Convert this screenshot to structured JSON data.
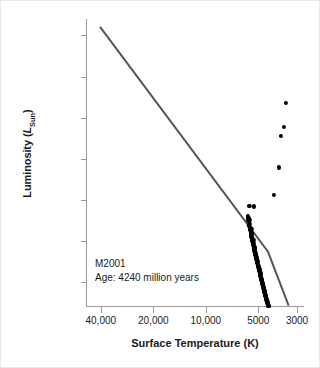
{
  "chart_data": {
    "type": "scatter",
    "title": "",
    "xlabel": "Surface Temperature (K)",
    "ylabel": "Luminosity (L_Sun)",
    "ylabel_parts": {
      "prefix": "Luminosity (",
      "italic": "L",
      "sub": "Sun",
      "suffix": ")"
    },
    "xscale": "log-reversed",
    "yscale": "log",
    "xlim": [
      48000,
      2700
    ],
    "ylim": [
      0.025,
      250000
    ],
    "xticks": [
      40000,
      20000,
      10000,
      5000,
      3000
    ],
    "xticklabels": [
      "40,000",
      "20,000",
      "10,000",
      "5000",
      "3000"
    ],
    "yticks": [
      100000,
      10000,
      1000,
      100,
      10,
      1,
      0.1
    ],
    "yticklabels": [
      "100,000",
      "10,000",
      "1000",
      "100",
      "10",
      "1",
      "0.1"
    ],
    "grid": false,
    "legend": null,
    "annotations": [
      {
        "name": "cluster-name",
        "text": "M2001"
      },
      {
        "name": "cluster-age",
        "text": "Age: 4240 million years"
      }
    ],
    "series": [
      {
        "name": "zero-age-main-sequence-line",
        "type": "line",
        "color": "#555555",
        "width": 2.0,
        "points": [
          [
            40400,
            160000
          ],
          [
            4400,
            0.55
          ],
          [
            3350,
            0.027
          ]
        ]
      },
      {
        "name": "main-sequence-stars",
        "type": "scatter",
        "color": "#000000",
        "marker": "circle",
        "size": 4.2,
        "points": [
          [
            5620,
            7.2
          ],
          [
            5280,
            7.0
          ],
          [
            5760,
            4.1
          ],
          [
            5700,
            3.7
          ],
          [
            5660,
            3.5
          ],
          [
            5710,
            3.2
          ],
          [
            5650,
            2.9
          ],
          [
            5600,
            3.3
          ],
          [
            5580,
            2.6
          ],
          [
            5640,
            2.4
          ],
          [
            5560,
            2.2
          ],
          [
            5600,
            2.0
          ],
          [
            5520,
            2.1
          ],
          [
            5560,
            1.85
          ],
          [
            5500,
            1.7
          ],
          [
            5540,
            1.6
          ],
          [
            5470,
            1.55
          ],
          [
            5510,
            1.45
          ],
          [
            5450,
            1.35
          ],
          [
            5480,
            1.28
          ],
          [
            5420,
            1.22
          ],
          [
            5440,
            1.15
          ],
          [
            5390,
            1.1
          ],
          [
            5410,
            1.02
          ],
          [
            5360,
            0.97
          ],
          [
            5380,
            0.92
          ],
          [
            5330,
            0.88
          ],
          [
            5350,
            0.82
          ],
          [
            5300,
            0.78
          ],
          [
            5320,
            0.74
          ],
          [
            5270,
            0.7
          ],
          [
            5290,
            0.66
          ],
          [
            5240,
            0.62
          ],
          [
            5260,
            0.59
          ],
          [
            5210,
            0.56
          ],
          [
            5230,
            0.53
          ],
          [
            5180,
            0.5
          ],
          [
            5200,
            0.47
          ],
          [
            5150,
            0.45
          ],
          [
            5170,
            0.42
          ],
          [
            5120,
            0.4
          ],
          [
            5140,
            0.38
          ],
          [
            5090,
            0.36
          ],
          [
            5110,
            0.34
          ],
          [
            5060,
            0.32
          ],
          [
            5080,
            0.3
          ],
          [
            5020,
            0.285
          ],
          [
            5040,
            0.27
          ],
          [
            4990,
            0.255
          ],
          [
            5010,
            0.24
          ],
          [
            4960,
            0.228
          ],
          [
            4980,
            0.216
          ],
          [
            4930,
            0.205
          ],
          [
            4950,
            0.194
          ],
          [
            4900,
            0.184
          ],
          [
            4920,
            0.174
          ],
          [
            4870,
            0.165
          ],
          [
            4890,
            0.156
          ],
          [
            4840,
            0.148
          ],
          [
            4860,
            0.14
          ],
          [
            4810,
            0.133
          ],
          [
            4830,
            0.126
          ],
          [
            4780,
            0.119
          ],
          [
            4800,
            0.113
          ],
          [
            4750,
            0.107
          ],
          [
            4770,
            0.101
          ],
          [
            4720,
            0.096
          ],
          [
            4740,
            0.091
          ],
          [
            4690,
            0.086
          ],
          [
            4710,
            0.081
          ],
          [
            4660,
            0.077
          ],
          [
            4680,
            0.073
          ],
          [
            4630,
            0.069
          ],
          [
            4650,
            0.065
          ],
          [
            4600,
            0.062
          ],
          [
            4620,
            0.058
          ],
          [
            4570,
            0.055
          ],
          [
            4590,
            0.052
          ],
          [
            4540,
            0.049
          ],
          [
            4560,
            0.047
          ],
          [
            4510,
            0.044
          ],
          [
            4530,
            0.042
          ],
          [
            4480,
            0.04
          ],
          [
            4500,
            0.038
          ],
          [
            4450,
            0.036
          ],
          [
            4470,
            0.034
          ],
          [
            4420,
            0.032
          ],
          [
            4440,
            0.031
          ],
          [
            4390,
            0.029
          ],
          [
            4410,
            0.028
          ],
          [
            4360,
            0.027
          ],
          [
            4380,
            0.026
          ],
          [
            5480,
            1.95
          ],
          [
            5430,
            1.42
          ],
          [
            5340,
            1.05
          ],
          [
            5250,
            0.68
          ],
          [
            5160,
            0.43
          ],
          [
            5070,
            0.31
          ],
          [
            4975,
            0.235
          ],
          [
            4880,
            0.17
          ],
          [
            4790,
            0.115
          ],
          [
            4700,
            0.084
          ],
          [
            4610,
            0.06
          ],
          [
            4520,
            0.045
          ],
          [
            4430,
            0.033
          ],
          [
            4345,
            0.0265
          ]
        ]
      },
      {
        "name": "red-giant-branch-stars",
        "type": "scatter",
        "color": "#000000",
        "marker": "circle",
        "size": 4.2,
        "points": [
          [
            3460,
            2250
          ],
          [
            3560,
            600
          ],
          [
            3720,
            360
          ],
          [
            3830,
            62
          ],
          [
            4050,
            13.5
          ]
        ]
      }
    ]
  }
}
